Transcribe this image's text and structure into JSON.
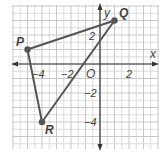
{
  "chart_data": {
    "type": "scatter",
    "title": "",
    "xlabel": "x",
    "ylabel": "y",
    "origin_label": "O",
    "xlim": [
      -6,
      4
    ],
    "ylim": [
      -6,
      4
    ],
    "grid": true,
    "x_tick_labels": [
      "-4",
      "-2",
      "2"
    ],
    "x_ticks": [
      -4,
      -2,
      2
    ],
    "y_tick_labels": [
      "2",
      "-2",
      "-4"
    ],
    "y_ticks": [
      2,
      -2,
      -4
    ],
    "points": [
      {
        "label": "P",
        "x": -5,
        "y": 1
      },
      {
        "label": "Q",
        "x": 1,
        "y": 3
      },
      {
        "label": "R",
        "x": -4,
        "y": -4
      }
    ],
    "polygon": [
      "P",
      "Q",
      "R"
    ],
    "colors": {
      "grid": "#d4d4d4",
      "axis": "#333333",
      "triangle": "#555555",
      "label": "#444444"
    }
  },
  "labels": {
    "x_axis": "x",
    "y_axis": "y",
    "origin": "O",
    "x_ticks": [
      "−4",
      "−2",
      "2"
    ],
    "y_ticks": [
      "2",
      "−2",
      "−4"
    ],
    "points": {
      "P": "P",
      "Q": "Q",
      "R": "R"
    }
  }
}
